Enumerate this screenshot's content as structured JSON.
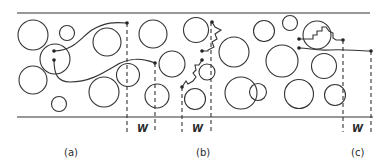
{
  "figure": {
    "type": "schematic diagram of paths through a channel packed with circular obstacles",
    "panel_labels": [
      "(a)",
      "(b)",
      "(c)"
    ],
    "width_label": "W",
    "colors": {
      "stroke": "#333333",
      "background": "#ffffff"
    },
    "channel": {
      "top_y": 13,
      "bottom_y": 117,
      "x_start": 17,
      "x_end": 372
    },
    "panels": [
      {
        "label": "(a)",
        "label_x": 70,
        "label_y": 156,
        "w_label_x": 141,
        "w_label_y": 131,
        "dashed_x": [
          127,
          155
        ]
      },
      {
        "label": "(b)",
        "label_x": 204,
        "label_y": 156,
        "w_label_x": 196,
        "w_label_y": 131,
        "dashed_x": [
          182,
          211
        ]
      },
      {
        "label": "(c)",
        "label_x": 357,
        "label_y": 156,
        "w_label_x": 357,
        "w_label_y": 131,
        "dashed_x": [
          343,
          371
        ]
      }
    ],
    "circles": [
      [
        33,
        35,
        15
      ],
      [
        67,
        33,
        7.5
      ],
      [
        107,
        42,
        14
      ],
      [
        55,
        59,
        15
      ],
      [
        33,
        80,
        14
      ],
      [
        104,
        92,
        15
      ],
      [
        59,
        104,
        7.5
      ],
      [
        128,
        75,
        11.5
      ],
      [
        153,
        34,
        14
      ],
      [
        172,
        64,
        13
      ],
      [
        157,
        96,
        12
      ],
      [
        196,
        30,
        12.5
      ],
      [
        207,
        72,
        8
      ],
      [
        195,
        99,
        10.5
      ],
      [
        234,
        52,
        15
      ],
      [
        241,
        93,
        16
      ],
      [
        264,
        31,
        10.5
      ],
      [
        290,
        23,
        7.5
      ],
      [
        282,
        61,
        16
      ],
      [
        317,
        35,
        14
      ],
      [
        324,
        66,
        12.5
      ],
      [
        258,
        92,
        8.5
      ],
      [
        299,
        94,
        14.5
      ],
      [
        335,
        95,
        10.5
      ]
    ]
  }
}
